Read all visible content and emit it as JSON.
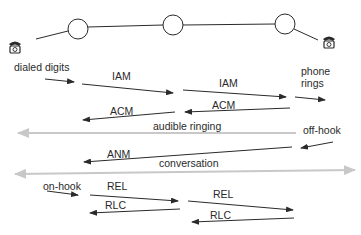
{
  "diagram": {
    "type": "sequence",
    "title": "",
    "nodes": [
      {
        "id": "caller-phone",
        "kind": "telephone",
        "icon": "telephone-icon"
      },
      {
        "id": "switch-1",
        "kind": "exchange"
      },
      {
        "id": "switch-2",
        "kind": "exchange"
      },
      {
        "id": "switch-3",
        "kind": "exchange"
      },
      {
        "id": "callee-phone",
        "kind": "telephone",
        "icon": "telephone-icon"
      }
    ],
    "labels": {
      "dialed_digits": "dialed digits",
      "phone_rings_1": "phone",
      "phone_rings_2": "rings",
      "audible_ringing": "audible ringing",
      "off_hook": "off-hook",
      "conversation": "conversation",
      "on_hook": "on-hook"
    },
    "messages": [
      {
        "label": "IAM",
        "from": "switch-1",
        "to": "switch-2"
      },
      {
        "label": "IAM",
        "from": "switch-2",
        "to": "switch-3"
      },
      {
        "label": "ACM",
        "from": "switch-2",
        "to": "switch-1"
      },
      {
        "label": "ACM",
        "from": "switch-3",
        "to": "switch-2"
      },
      {
        "label": "ANM",
        "from": "switch-3",
        "to": "switch-1"
      },
      {
        "label": "REL",
        "from": "switch-1",
        "to": "switch-2"
      },
      {
        "label": "REL",
        "from": "switch-2",
        "to": "switch-3"
      },
      {
        "label": "RLC",
        "from": "switch-2",
        "to": "switch-1"
      },
      {
        "label": "RLC",
        "from": "switch-3",
        "to": "switch-2"
      }
    ],
    "colors": {
      "line": "#2a2a2a",
      "grey_arrow": "#c8c8c8",
      "background": "#ffffff"
    }
  }
}
